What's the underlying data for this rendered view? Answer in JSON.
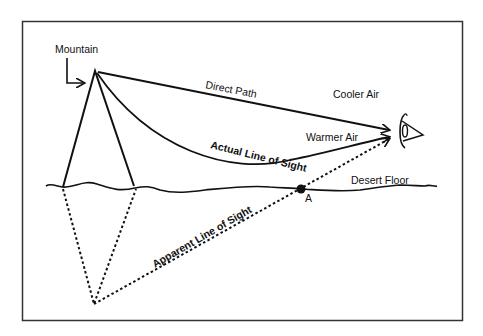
{
  "diagram": {
    "labels": {
      "mountain": "Mountain",
      "direct_path": "Direct Path",
      "cooler_air": "Cooler Air",
      "warmer_air": "Warmer Air",
      "actual_line_of_sight": "Actual Line of Sight",
      "apparent_line_of_sight": "Apparent Line of Sight",
      "desert_floor": "Desert Floor",
      "point_a": "A"
    },
    "colors": {
      "ink": "#111111",
      "background": "#ffffff",
      "frame": "#333333"
    }
  }
}
